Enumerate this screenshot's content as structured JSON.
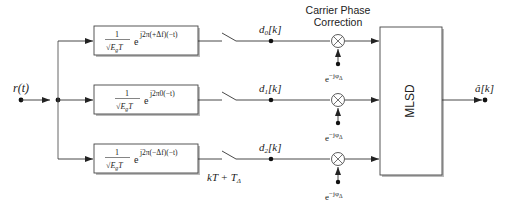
{
  "diagram": {
    "input": {
      "label": "r(t)"
    },
    "output": {
      "label": "â[k]"
    },
    "filters": [
      {
        "num": "1",
        "den": "√E",
        "den_sub": "g",
        "den_t": "T",
        "exp_base": "e",
        "exponent": "j2π(+Δf)(−t)"
      },
      {
        "num": "1",
        "den": "√E",
        "den_sub": "g",
        "den_t": "T",
        "exp_base": "e",
        "exponent": "j2π0(−t)"
      },
      {
        "num": "1",
        "den": "√E",
        "den_sub": "g",
        "den_t": "T",
        "exp_base": "e",
        "exponent": "j2π(−Δf)(−t)"
      }
    ],
    "sampler": {
      "label": "kT + T",
      "label_sub": "Δ"
    },
    "branch_outputs": [
      {
        "label": "d",
        "sub": "0",
        "suffix": "[k]"
      },
      {
        "label": "d",
        "sub": "1",
        "suffix": "[k]"
      },
      {
        "label": "d",
        "sub": "2",
        "suffix": "[k]"
      }
    ],
    "phase_correction": {
      "title_line1": "Carrier Phase",
      "title_line2": "Correction",
      "multiplier_symbol": "×",
      "phasor_base": "e",
      "phasor_exp": "−jφ",
      "phasor_sub": "Δ"
    },
    "detector": {
      "label": "MLSD"
    },
    "colors": {
      "line": "#333333",
      "block_border": "#444444",
      "shadow": "#bbbbbb",
      "text": "#222222"
    }
  }
}
